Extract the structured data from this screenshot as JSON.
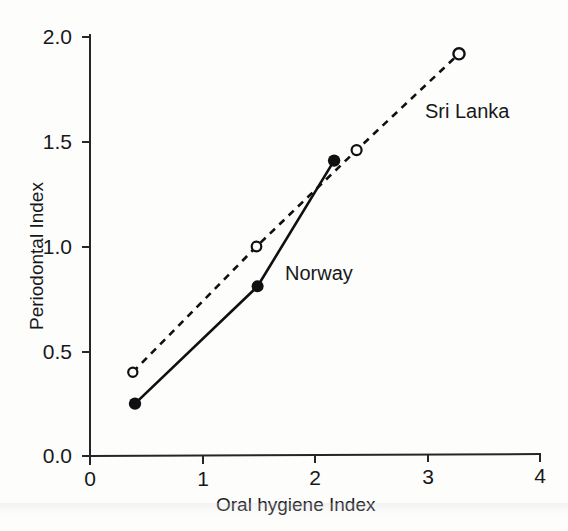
{
  "chart_data": {
    "type": "line",
    "title": "",
    "subtitle": "",
    "xlabel": "Oral hygiene Index",
    "ylabel": "Periodontal Index",
    "xlim": [
      0,
      4
    ],
    "ylim": [
      0.0,
      2.0
    ],
    "xticks": [
      "0",
      "1",
      "2",
      "3",
      "4"
    ],
    "xtick_values": [
      0,
      1,
      2,
      3,
      4
    ],
    "yticks": [
      "0.0",
      "0.5",
      "1.0",
      "1.5",
      "2.0"
    ],
    "ytick_values": [
      0.0,
      0.5,
      1.0,
      1.5,
      2.0
    ],
    "grid": false,
    "legend_position": "inline-annotations",
    "series": [
      {
        "name": "Norway",
        "line_style": "solid",
        "marker": "filled-circle",
        "color": "#101012",
        "x": [
          0.4,
          1.49,
          2.17
        ],
        "y": [
          0.25,
          0.81,
          1.41
        ]
      },
      {
        "name": "Sri Lanka",
        "line_style": "dashed",
        "marker": "open-circle",
        "color": "#101012",
        "x": [
          0.38,
          1.48,
          2.37,
          3.28
        ],
        "y": [
          0.4,
          1.0,
          1.46,
          1.92
        ]
      }
    ],
    "annotations": [
      {
        "text": "Sri Lanka",
        "x": 3.02,
        "y": 1.64
      },
      {
        "text": "Norway",
        "x": 1.96,
        "y": 0.93
      }
    ]
  },
  "axes": {
    "x_title": "Oral hygiene Index",
    "y_title": "Periodontal Index",
    "x_tick_labels": [
      "0",
      "1",
      "2",
      "3",
      "4"
    ],
    "y_tick_labels": [
      "0.0",
      "0.5",
      "1.0",
      "1.5",
      "2.0"
    ]
  },
  "annotations": {
    "sri_lanka_label": "Sri Lanka",
    "norway_label": "Norway"
  },
  "colors": {
    "ink": "#101012",
    "paper": "#fdfdfc"
  }
}
